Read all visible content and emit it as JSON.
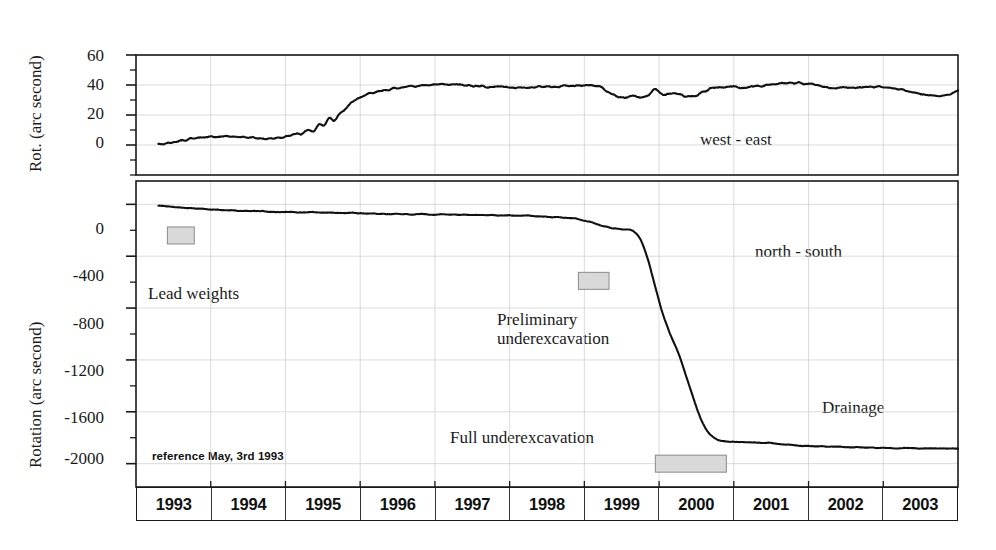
{
  "figure": {
    "background": "#ffffff",
    "line_color": "#111111",
    "grid_color": "#cccccc",
    "axis_color": "#1a1a1a",
    "shade_box_fill": "#d9d9d9",
    "shade_box_stroke": "#8a8a8a"
  },
  "top_panel": {
    "ylabel": "Rot. (arc second)",
    "yticks": [
      "60",
      "40",
      "20",
      "0"
    ],
    "series_label": "west - east"
  },
  "bottom_panel": {
    "ylabel": "Rotation (arc second)",
    "yticks": [
      "0",
      "-400",
      "-800",
      "-1200",
      "-1600",
      "-2000"
    ],
    "series_label": "north - south",
    "reference_note": "reference May, 3rd 1993",
    "annotations": [
      {
        "name": "lead-weights",
        "text": "Lead weights"
      },
      {
        "name": "preliminary-underexcavation",
        "text": "Preliminary\nunderexcavation"
      },
      {
        "name": "full-underexcavation",
        "text": "Full underexcavation"
      },
      {
        "name": "drainage",
        "text": "Drainage"
      }
    ]
  },
  "xaxis": {
    "years": [
      "1993",
      "1994",
      "1995",
      "1996",
      "1997",
      "1998",
      "1999",
      "2000",
      "2001",
      "2002",
      "2003"
    ]
  },
  "chart_data": {
    "type": "line",
    "title": "",
    "xlabel": "",
    "panels": [
      {
        "name": "west-east",
        "ylabel": "Rot. (arc second)",
        "ylim": [
          -20,
          60
        ],
        "yticks": [
          0,
          20,
          40,
          60
        ],
        "minor_tick_step": 10,
        "xlim": [
          1993.0,
          2004.0
        ],
        "grid": true,
        "legend_text": "west - east",
        "series": [
          {
            "name": "west - east",
            "units": "arc second",
            "x": [
              1993.3,
              1993.45,
              1993.6,
              1993.8,
              1994.0,
              1994.2,
              1994.4,
              1994.6,
              1994.8,
              1994.95,
              1995.05,
              1995.15,
              1995.22,
              1995.3,
              1995.38,
              1995.45,
              1995.52,
              1995.58,
              1995.65,
              1995.72,
              1995.8,
              1995.9,
              1996.05,
              1996.25,
              1996.5,
              1996.8,
              1997.1,
              1997.4,
              1997.7,
              1998.0,
              1998.3,
              1998.6,
              1998.9,
              1999.05,
              1999.2,
              1999.35,
              1999.45,
              1999.55,
              1999.65,
              1999.75,
              1999.85,
              1999.95,
              2000.05,
              2000.2,
              2000.35,
              2000.5,
              2000.7,
              2000.9,
              2001.1,
              2001.3,
              2001.5,
              2001.7,
              2001.9,
              2002.1,
              2002.3,
              2002.5,
              2002.7,
              2002.9,
              2003.1,
              2003.3,
              2003.5,
              2003.7,
              2003.9,
              2004.0
            ],
            "y": [
              0,
              1.5,
              3.0,
              4.5,
              5.5,
              6.0,
              5.5,
              4.5,
              4.5,
              5.0,
              6.5,
              8.0,
              7.0,
              11.0,
              9.0,
              15.0,
              12.0,
              19.0,
              15.5,
              21.0,
              24.0,
              29.0,
              33.0,
              36.0,
              38.0,
              39.5,
              40.5,
              40.0,
              39.0,
              38.5,
              38.5,
              39.0,
              39.5,
              40.0,
              39.0,
              34.0,
              32.0,
              31.5,
              32.5,
              31.5,
              33.0,
              38.0,
              33.0,
              35.0,
              32.5,
              33.0,
              38.0,
              39.0,
              38.0,
              39.0,
              40.5,
              41.0,
              41.5,
              40.0,
              38.0,
              38.5,
              38.5,
              39.0,
              38.0,
              36.5,
              34.0,
              32.5,
              33.5,
              36.0
            ]
          }
        ]
      },
      {
        "name": "north-south",
        "ylabel": "Rotation (arc second)",
        "ylim": [
          -2180,
          180
        ],
        "yticks": [
          0,
          -400,
          -800,
          -1200,
          -1600,
          -2000
        ],
        "minor_tick_step": 200,
        "xlim": [
          1993.0,
          2004.0
        ],
        "grid": true,
        "legend_text": "north - south",
        "series": [
          {
            "name": "north - south",
            "units": "arc second",
            "x": [
              1993.3,
              1993.6,
              1994.0,
              1994.5,
              1995.0,
              1995.5,
              1996.0,
              1996.5,
              1997.0,
              1997.5,
              1998.0,
              1998.3,
              1998.5,
              1998.7,
              1998.9,
              1999.0,
              1999.1,
              1999.25,
              1999.4,
              1999.55,
              1999.65,
              1999.75,
              1999.85,
              1999.95,
              2000.05,
              2000.15,
              2000.25,
              2000.35,
              2000.45,
              2000.55,
              2000.65,
              2000.75,
              2000.85,
              2000.95,
              2001.1,
              2001.3,
              2001.5,
              2001.7,
              2001.9,
              2002.2,
              2002.5,
              2002.8,
              2003.2,
              2003.6,
              2004.0
            ],
            "y": [
              -10,
              -25,
              -40,
              -50,
              -60,
              -62,
              -70,
              -75,
              -78,
              -82,
              -85,
              -90,
              -95,
              -100,
              -110,
              -125,
              -140,
              -170,
              -185,
              -195,
              -200,
              -260,
              -420,
              -640,
              -850,
              -1010,
              -1130,
              -1300,
              -1480,
              -1650,
              -1760,
              -1810,
              -1825,
              -1830,
              -1835,
              -1838,
              -1840,
              -1855,
              -1862,
              -1868,
              -1872,
              -1876,
              -1880,
              -1882,
              -1885
            ]
          }
        ],
        "event_markers": [
          {
            "label": "Lead weights",
            "x_start": 1993.42,
            "x_end": 1993.78,
            "y_center": -240
          },
          {
            "label": "Preliminary underexcavation",
            "x_start": 1998.92,
            "x_end": 1999.33,
            "y_center": -590
          },
          {
            "label": "Full underexcavation",
            "x_start": 1999.95,
            "x_end": 2000.9,
            "y_center": -2000
          }
        ]
      }
    ]
  }
}
